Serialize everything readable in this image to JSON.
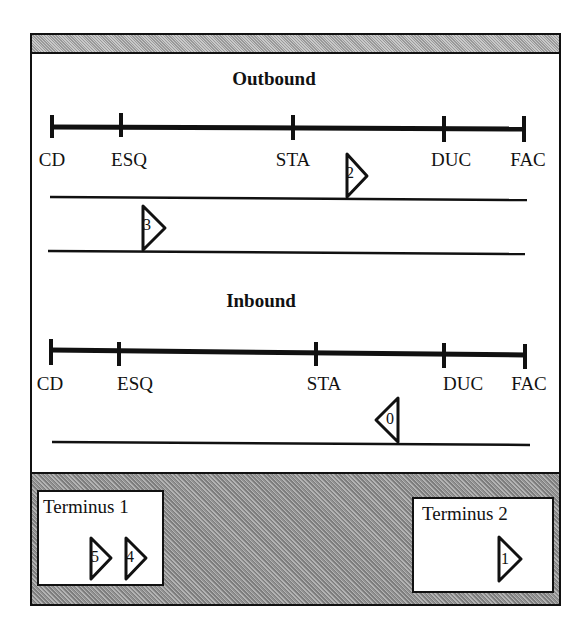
{
  "outbound": {
    "title": "Outbound",
    "stops": [
      {
        "label": "CD",
        "x": 52
      },
      {
        "label": "ESQ",
        "x": 121
      },
      {
        "label": "STA",
        "x": 293
      },
      {
        "label": "DUC",
        "x": 444
      },
      {
        "label": "FAC",
        "x": 524
      }
    ],
    "buses": [
      {
        "id": "2",
        "direction": "right",
        "track": 1
      },
      {
        "id": "3",
        "direction": "right",
        "track": 2
      }
    ]
  },
  "inbound": {
    "title": "Inbound",
    "stops": [
      {
        "label": "CD",
        "x": 51
      },
      {
        "label": "ESQ",
        "x": 119
      },
      {
        "label": "STA",
        "x": 316
      },
      {
        "label": "DUC",
        "x": 444
      },
      {
        "label": "FAC",
        "x": 525
      }
    ],
    "buses": [
      {
        "id": "0",
        "direction": "left",
        "track": 1
      }
    ]
  },
  "termini": [
    {
      "label": "Terminus 1",
      "buses": [
        "5",
        "4"
      ]
    },
    {
      "label": "Terminus 2",
      "buses": [
        "1"
      ]
    }
  ],
  "colors": {
    "ink": "#111111",
    "background": "#ffffff",
    "panel_gray": "#999999"
  }
}
